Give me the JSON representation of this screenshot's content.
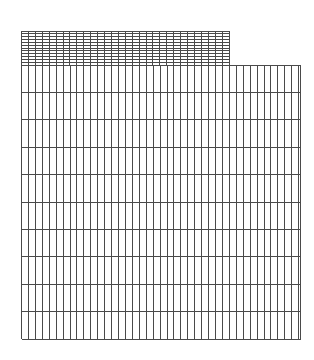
{
  "figure": {
    "width": 314,
    "height": 360,
    "background": "#ffffff",
    "line_color": "#4a4a4a",
    "line_width": 1
  },
  "grids": [
    {
      "name": "upper-fine-grid",
      "x": 21.5,
      "y": 31,
      "width": 207.5,
      "height": 34,
      "columns": 30,
      "rows": 12
    },
    {
      "name": "lower-coarse-grid",
      "x": 21.5,
      "y": 65,
      "width": 279,
      "height": 274,
      "columns": 40,
      "column_width": 6.93,
      "rows": 10
    }
  ]
}
